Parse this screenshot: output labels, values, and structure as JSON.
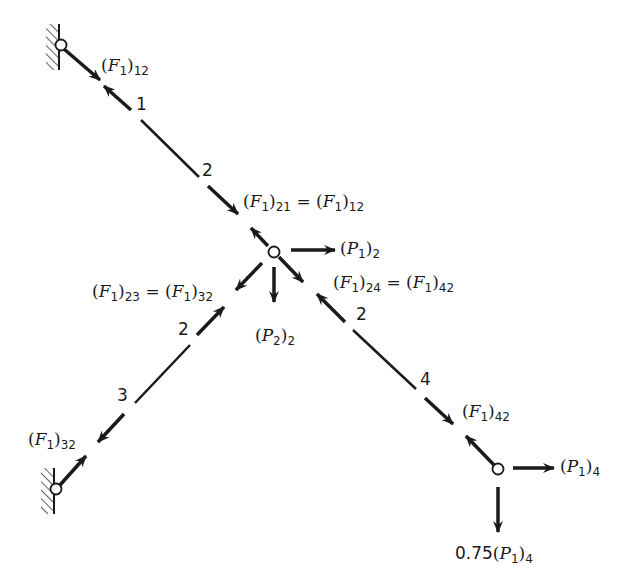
{
  "diagram": {
    "colors": {
      "ink": "#1a1a1a",
      "background": "#ffffff"
    },
    "joints": [
      {
        "id": "1",
        "type": "pin-support-wall",
        "x": 61,
        "y": 45
      },
      {
        "id": "2",
        "type": "free-joint",
        "x": 274,
        "y": 252
      },
      {
        "id": "3",
        "type": "pin-support-wall",
        "x": 56,
        "y": 489
      },
      {
        "id": "4",
        "type": "free-joint",
        "x": 498,
        "y": 469
      }
    ],
    "members": [
      {
        "from": "1",
        "to": "2",
        "end_labels": [
          "1",
          "2"
        ]
      },
      {
        "from": "2",
        "to": "3",
        "end_labels": [
          "2",
          "3"
        ]
      },
      {
        "from": "2",
        "to": "4",
        "end_labels": [
          "2",
          "4"
        ]
      }
    ],
    "member_end_labels": {
      "m12_end1": "1",
      "m12_end2": "2",
      "m23_end2": "2",
      "m23_end3": "3",
      "m24_end2": "2",
      "m24_end4": "4"
    },
    "labels": {
      "f12": {
        "base": "(F",
        "sub1": "1",
        "close": ")",
        "sub2": "12"
      },
      "f21_eq": {
        "text": "(F1)21 = (F1)12"
      },
      "f23_eq": {
        "text": "(F1)23 = (F1)32"
      },
      "f24_eq": {
        "text": "(F1)24 = (F1)42"
      },
      "f32": {
        "text": "(F1)32"
      },
      "f42": {
        "text": "(F1)42"
      },
      "p1_2": {
        "text": "(P1)2"
      },
      "p2_2": {
        "text": "(P2)2"
      },
      "p1_4": {
        "text": "(P1)4"
      },
      "p1_4_vert": {
        "coef": "0.75",
        "text": "0.75(P1)4"
      }
    },
    "applied_loads": [
      {
        "joint": "2",
        "name": "(P1)2",
        "direction": "right"
      },
      {
        "joint": "2",
        "name": "(P2)2",
        "direction": "down"
      },
      {
        "joint": "4",
        "name": "(P1)4",
        "direction": "right"
      },
      {
        "joint": "4",
        "name": "0.75(P1)4",
        "direction": "down"
      }
    ]
  }
}
